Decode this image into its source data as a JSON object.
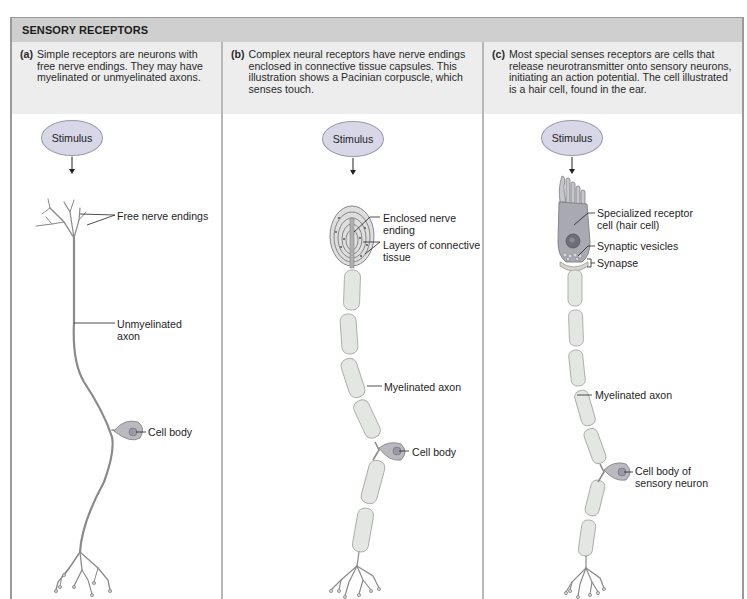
{
  "figure": {
    "title": "SENSORY RECEPTORS",
    "colors": {
      "title_bar_bg": "#cfcfcf",
      "caption_bg": "#ededed",
      "stimulus_fill": "#d7d7e7",
      "neuron_stroke": "#8a8a8a",
      "myelin_fill": "#e4e6e4",
      "cell_body_fill": "#b9b9bf"
    }
  },
  "panels": [
    {
      "letter": "(a)",
      "caption": "Simple receptors are neurons with free nerve endings. They may have myelinated or unmyelinated axons.",
      "stimulus": "Stimulus",
      "labels": {
        "endings": "Free nerve endings",
        "axon_1": "Unmyelinated",
        "axon_2": "axon",
        "cell_body": "Cell body"
      }
    },
    {
      "letter": "(b)",
      "caption": "Complex neural receptors have nerve endings enclosed in connective tissue capsules. This illustration shows a Pacinian corpuscle, which senses touch.",
      "stimulus": "Stimulus",
      "labels": {
        "enclosed_1": "Enclosed nerve",
        "enclosed_2": "ending",
        "layers_1": "Layers of connective",
        "layers_2": "tissue",
        "axon": "Myelinated axon",
        "cell_body": "Cell body"
      }
    },
    {
      "letter": "(c)",
      "caption": "Most special senses receptors are cells that release neurotransmitter onto sensory neurons, initiating an action potential. The cell illustrated is a hair cell, found in the ear.",
      "stimulus": "Stimulus",
      "labels": {
        "receptor_1": "Specialized receptor",
        "receptor_2": "cell (hair cell)",
        "vesicles": "Synaptic vesicles",
        "synapse": "Synapse",
        "axon": "Myelinated axon",
        "cell_body_1": "Cell body of",
        "cell_body_2": "sensory neuron"
      }
    }
  ]
}
